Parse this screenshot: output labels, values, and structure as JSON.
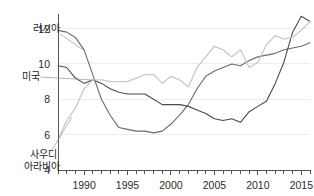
{
  "chart_data": {
    "type": "line",
    "title": "",
    "subtitle": "",
    "xlabel": "",
    "ylabel": "",
    "xlim": [
      1987,
      2016
    ],
    "ylim": [
      4,
      12.6
    ],
    "yticks": [
      4,
      6,
      8,
      10,
      12
    ],
    "ytick_labels": [
      "4",
      "6",
      "8",
      "10",
      "12"
    ],
    "xticks": [
      1990,
      1995,
      2000,
      2005,
      2010,
      2015
    ],
    "xtick_labels": [
      "1990",
      "1995",
      "2000",
      "2005",
      "2010",
      "2015"
    ],
    "minor_xticks_every": 1,
    "grid": "horizontal",
    "legend_position": "inline-labels",
    "x": [
      1987,
      1988,
      1989,
      1990,
      1991,
      1992,
      1993,
      1994,
      1995,
      1996,
      1997,
      1998,
      1999,
      2000,
      2001,
      2002,
      2003,
      2004,
      2005,
      2006,
      2007,
      2008,
      2009,
      2010,
      2011,
      2012,
      2013,
      2014,
      2015,
      2016
    ],
    "series": [
      {
        "name": "러시아",
        "label": "러시아",
        "color": "#6b6b6b",
        "values": [
          11.9,
          11.8,
          11.5,
          10.8,
          9.4,
          8.0,
          7.1,
          6.4,
          6.3,
          6.2,
          6.2,
          6.1,
          6.2,
          6.6,
          7.1,
          7.7,
          8.6,
          9.3,
          9.6,
          9.8,
          10.0,
          9.9,
          10.2,
          10.4,
          10.5,
          10.6,
          10.8,
          10.9,
          11.0,
          11.2
        ]
      },
      {
        "name": "미국",
        "label": "미국",
        "color": "#4a4a4a",
        "values": [
          9.9,
          9.8,
          9.2,
          8.9,
          9.1,
          8.9,
          8.6,
          8.4,
          8.3,
          8.3,
          8.3,
          8.0,
          7.7,
          7.7,
          7.7,
          7.6,
          7.4,
          7.2,
          6.9,
          6.8,
          6.9,
          6.7,
          7.3,
          7.6,
          7.9,
          8.9,
          10.1,
          11.8,
          12.7,
          12.4
        ]
      },
      {
        "name": "사우디 아라비아",
        "label": "사우디 아라비아",
        "color": "#c9c9c9",
        "values": [
          5.7,
          6.8,
          7.5,
          8.6,
          9.1,
          9.1,
          9.0,
          9.0,
          9.0,
          9.2,
          9.4,
          9.4,
          8.9,
          9.3,
          9.1,
          8.7,
          9.8,
          10.4,
          11.0,
          10.8,
          10.4,
          10.8,
          9.8,
          10.1,
          11.1,
          11.6,
          11.4,
          11.5,
          11.9,
          12.4
        ]
      }
    ]
  },
  "labels": {
    "russia": "러시아",
    "usa": "미국",
    "saudi_line1": "사우디",
    "saudi_line2": "아라비아"
  },
  "axis": {
    "y_ticks": [
      "12",
      "10",
      "8",
      "6",
      "4"
    ],
    "x_ticks": [
      "1990",
      "1995",
      "2000",
      "2005",
      "2010",
      "2015"
    ]
  },
  "colors": {
    "russia": "#6b6b6b",
    "usa": "#4a4a4a",
    "saudi": "#c9c9c9",
    "axis": "#555555",
    "grid": "#f0eeec",
    "text": "#2b2b2b"
  }
}
